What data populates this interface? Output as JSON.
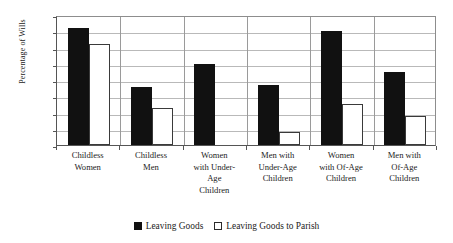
{
  "chart_data": {
    "type": "bar",
    "title": "",
    "xlabel": "",
    "ylabel": "Percentage of Wills",
    "ylim": [
      0,
      80
    ],
    "ytick_step": 10,
    "yticks": [
      80,
      70,
      60,
      50,
      40,
      30,
      20,
      10,
      0
    ],
    "grid": true,
    "legend_position": "bottom",
    "categories": [
      "Childless Women",
      "Childless Men",
      "Women with Under-Age Children",
      "Men with Under-Age Children",
      "Women with Of-Age Children",
      "Men with Of-Age Children"
    ],
    "category_lines": [
      [
        "Childless",
        "Women"
      ],
      [
        "Childless",
        "Men"
      ],
      [
        "Women",
        "with Under-",
        "Age",
        "Children"
      ],
      [
        "Men with",
        "Under-Age",
        "Children"
      ],
      [
        "Women",
        "with Of-Age",
        "Children"
      ],
      [
        "Men with",
        "Of-Age",
        "Children"
      ]
    ],
    "series": [
      {
        "name": "Leaving Goods",
        "color": "#111111",
        "values": [
          72,
          36,
          50,
          37,
          70,
          45
        ]
      },
      {
        "name": "Leaving Goods to Parish",
        "color": "#ffffff",
        "values": [
          62,
          23,
          0,
          8,
          25,
          18
        ]
      }
    ]
  },
  "legend": {
    "items": [
      {
        "label": "Leaving Goods",
        "swatch": "filled-square-icon"
      },
      {
        "label": "Leaving Goods to Parish",
        "swatch": "outlined-square-icon"
      }
    ]
  }
}
